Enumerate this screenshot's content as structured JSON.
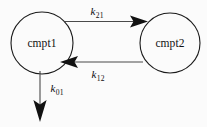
{
  "diagram": {
    "type": "two-compartment-model",
    "background_color": "#fbfbfb",
    "stroke_color": "#1a1a1a",
    "nodes": [
      {
        "id": "cmpt1",
        "label": "cmpt1",
        "shape": "circle",
        "cx": 42,
        "cy": 43,
        "r": 31
      },
      {
        "id": "cmpt2",
        "label": "cmpt2",
        "shape": "circle",
        "cx": 170,
        "cy": 43,
        "r": 30
      }
    ],
    "edges": [
      {
        "id": "k21",
        "label_base": "k",
        "label_sub": "21",
        "from": "cmpt1",
        "to": "cmpt2",
        "direction": "right"
      },
      {
        "id": "k12",
        "label_base": "k",
        "label_sub": "12",
        "from": "cmpt2",
        "to": "cmpt1",
        "direction": "left"
      },
      {
        "id": "k01",
        "label_base": "k",
        "label_sub": "01",
        "from": "cmpt1",
        "to": "elimination",
        "direction": "down"
      }
    ]
  }
}
